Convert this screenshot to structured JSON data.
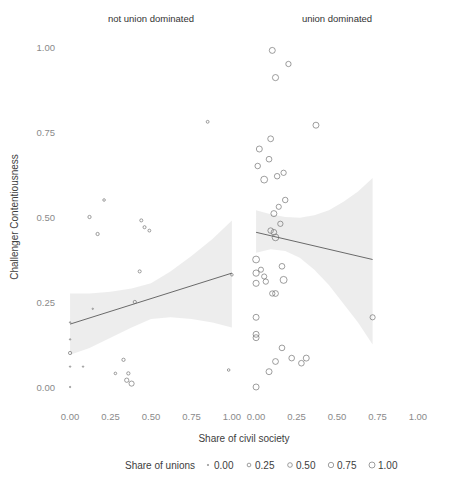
{
  "figure": {
    "ylabel": "Challenger Contentiousness",
    "xlabel": "Share of civil society"
  },
  "panels": [
    {
      "id": "not-union-dominated",
      "label": "not union dominated"
    },
    {
      "id": "union-dominated",
      "label": "union dominated"
    }
  ],
  "axes": {
    "y_ticks": [
      "0.00",
      "0.25",
      "0.50",
      "0.75",
      "1.00"
    ],
    "y_tick_values": [
      0.0,
      0.25,
      0.5,
      0.75,
      1.0
    ],
    "x_ticks": [
      "0.00",
      "0.25",
      "0.50",
      "0.75",
      "1.00"
    ],
    "x_tick_values": [
      0.0,
      0.25,
      0.5,
      0.75,
      1.0
    ],
    "xlim": [
      -0.05,
      1.05
    ],
    "ylim": [
      -0.05,
      1.05
    ]
  },
  "legend": {
    "title": "Share of unions",
    "keys": [
      {
        "label": "0.00",
        "size": 0.0
      },
      {
        "label": "0.25",
        "size": 0.25
      },
      {
        "label": "0.50",
        "size": 0.5
      },
      {
        "label": "0.75",
        "size": 0.75
      },
      {
        "label": "1.00",
        "size": 1.0
      }
    ]
  },
  "colors": {
    "point_stroke": "#6b6b6b",
    "line": "#5a5a5a",
    "ribbon": "#e2e2e2",
    "tick_text": "#8a8a8a",
    "title_text": "#333333"
  },
  "chart_data": {
    "type": "scatter",
    "title": "",
    "xlabel": "Share of civil society",
    "ylabel": "Challenger Contentiousness",
    "xlim": [
      -0.05,
      1.05
    ],
    "ylim": [
      -0.05,
      1.05
    ],
    "grid": false,
    "legend_position": "bottom",
    "size_legend": {
      "title": "Share of unions",
      "breaks": [
        0.0,
        0.25,
        0.5,
        0.75,
        1.0
      ]
    },
    "facets": [
      {
        "name": "not union dominated",
        "points": [
          {
            "x": 0.0,
            "y": 0.0,
            "size": 0.0
          },
          {
            "x": 0.0,
            "y": 0.06,
            "size": 0.0
          },
          {
            "x": 0.0,
            "y": 0.1,
            "size": 0.05
          },
          {
            "x": 0.0,
            "y": 0.14,
            "size": 0.0
          },
          {
            "x": 0.0,
            "y": 0.19,
            "size": 0.0
          },
          {
            "x": 0.08,
            "y": 0.06,
            "size": 0.0
          },
          {
            "x": 0.12,
            "y": 0.5,
            "size": 0.05
          },
          {
            "x": 0.14,
            "y": 0.23,
            "size": 0.0
          },
          {
            "x": 0.17,
            "y": 0.45,
            "size": 0.05
          },
          {
            "x": 0.21,
            "y": 0.55,
            "size": 0.02
          },
          {
            "x": 0.28,
            "y": 0.04,
            "size": 0.02
          },
          {
            "x": 0.33,
            "y": 0.08,
            "size": 0.05
          },
          {
            "x": 0.35,
            "y": 0.02,
            "size": 0.12
          },
          {
            "x": 0.36,
            "y": 0.04,
            "size": 0.05
          },
          {
            "x": 0.38,
            "y": 0.01,
            "size": 0.2
          },
          {
            "x": 0.4,
            "y": 0.25,
            "size": 0.05
          },
          {
            "x": 0.43,
            "y": 0.34,
            "size": 0.04
          },
          {
            "x": 0.44,
            "y": 0.49,
            "size": 0.04
          },
          {
            "x": 0.46,
            "y": 0.47,
            "size": 0.04
          },
          {
            "x": 0.49,
            "y": 0.46,
            "size": 0.03
          },
          {
            "x": 0.85,
            "y": 0.78,
            "size": 0.03
          },
          {
            "x": 0.98,
            "y": 0.05,
            "size": 0.02
          },
          {
            "x": 1.0,
            "y": 0.33,
            "size": 0.02
          }
        ],
        "fit": {
          "x0": 0.0,
          "y0": 0.185,
          "x1": 1.0,
          "y1": 0.335
        },
        "ribbon": {
          "x": [
            0.0,
            0.12,
            0.25,
            0.38,
            0.5,
            0.62,
            0.75,
            0.88,
            1.0
          ],
          "lower": [
            0.095,
            0.115,
            0.145,
            0.175,
            0.2,
            0.205,
            0.2,
            0.19,
            0.175
          ],
          "upper": [
            0.275,
            0.275,
            0.28,
            0.29,
            0.305,
            0.34,
            0.385,
            0.435,
            0.49
          ]
        }
      },
      {
        "name": "union dominated",
        "points": [
          {
            "x": 0.1,
            "y": 0.99,
            "size": 0.3
          },
          {
            "x": 0.2,
            "y": 0.95,
            "size": 0.22
          },
          {
            "x": 0.12,
            "y": 0.91,
            "size": 0.32
          },
          {
            "x": 0.37,
            "y": 0.77,
            "size": 0.3
          },
          {
            "x": 0.09,
            "y": 0.73,
            "size": 0.28
          },
          {
            "x": 0.02,
            "y": 0.7,
            "size": 0.3
          },
          {
            "x": 0.08,
            "y": 0.67,
            "size": 0.26
          },
          {
            "x": 0.01,
            "y": 0.65,
            "size": 0.24
          },
          {
            "x": 0.05,
            "y": 0.61,
            "size": 0.42
          },
          {
            "x": 0.13,
            "y": 0.62,
            "size": 0.24
          },
          {
            "x": 0.17,
            "y": 0.63,
            "size": 0.22
          },
          {
            "x": 0.18,
            "y": 0.55,
            "size": 0.24
          },
          {
            "x": 0.14,
            "y": 0.53,
            "size": 0.2
          },
          {
            "x": 0.11,
            "y": 0.51,
            "size": 0.3
          },
          {
            "x": 0.15,
            "y": 0.48,
            "size": 0.22
          },
          {
            "x": 0.09,
            "y": 0.46,
            "size": 0.24
          },
          {
            "x": 0.11,
            "y": 0.455,
            "size": 0.26
          },
          {
            "x": 0.12,
            "y": 0.44,
            "size": 0.4
          },
          {
            "x": 0.0,
            "y": 0.375,
            "size": 0.42
          },
          {
            "x": 0.0,
            "y": 0.335,
            "size": 0.34
          },
          {
            "x": 0.03,
            "y": 0.345,
            "size": 0.2
          },
          {
            "x": 0.05,
            "y": 0.325,
            "size": 0.2
          },
          {
            "x": 0.16,
            "y": 0.355,
            "size": 0.26
          },
          {
            "x": 0.0,
            "y": 0.305,
            "size": 0.32
          },
          {
            "x": 0.06,
            "y": 0.31,
            "size": 0.22
          },
          {
            "x": 0.17,
            "y": 0.315,
            "size": 0.44
          },
          {
            "x": 0.1,
            "y": 0.275,
            "size": 0.22
          },
          {
            "x": 0.12,
            "y": 0.275,
            "size": 0.28
          },
          {
            "x": 0.0,
            "y": 0.205,
            "size": 0.3
          },
          {
            "x": 0.72,
            "y": 0.205,
            "size": 0.2
          },
          {
            "x": 0.0,
            "y": 0.155,
            "size": 0.3
          },
          {
            "x": 0.0,
            "y": 0.145,
            "size": 0.3
          },
          {
            "x": 0.16,
            "y": 0.115,
            "size": 0.26
          },
          {
            "x": 0.22,
            "y": 0.085,
            "size": 0.26
          },
          {
            "x": 0.12,
            "y": 0.075,
            "size": 0.28
          },
          {
            "x": 0.31,
            "y": 0.085,
            "size": 0.3
          },
          {
            "x": 0.28,
            "y": 0.07,
            "size": 0.26
          },
          {
            "x": 0.08,
            "y": 0.045,
            "size": 0.3
          },
          {
            "x": 0.0,
            "y": 0.0,
            "size": 0.3
          }
        ],
        "fit": {
          "x0": 0.0,
          "y0": 0.455,
          "x1": 0.72,
          "y1": 0.375
        },
        "ribbon": {
          "x": [
            0.0,
            0.09,
            0.18,
            0.27,
            0.36,
            0.45,
            0.54,
            0.63,
            0.72
          ],
          "lower": [
            0.395,
            0.405,
            0.4,
            0.38,
            0.345,
            0.3,
            0.245,
            0.19,
            0.125
          ],
          "upper": [
            0.52,
            0.508,
            0.5,
            0.498,
            0.505,
            0.52,
            0.545,
            0.575,
            0.615
          ]
        }
      }
    ]
  }
}
